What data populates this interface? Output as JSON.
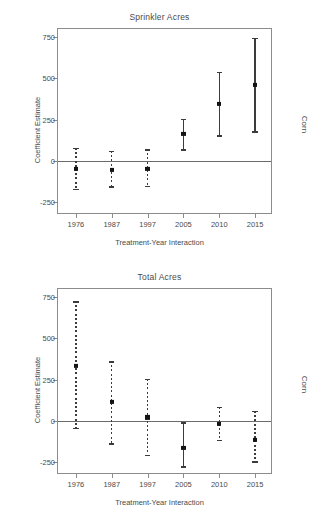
{
  "figure": {
    "strip_label": "Corn",
    "xlabel": "Treatment-Year Interaction",
    "ylabel": "Coefficient Estimate"
  },
  "chart_data": [
    {
      "type": "scatter",
      "title": "Sprinkler Acres",
      "xlabel": "Treatment-Year Interaction",
      "ylabel": "Coefficient Estimate",
      "strip_label": "Corn",
      "grid": false,
      "legend": "none",
      "zero_reference_line": 0,
      "ylim": [
        -330,
        800
      ],
      "yticks": [
        750,
        500,
        250,
        0,
        -250
      ],
      "ytick_labels": [
        "750",
        "500",
        "250",
        "0",
        "-250"
      ],
      "categories": [
        "1976",
        "1987",
        "1997",
        "2005",
        "2010",
        "2015"
      ],
      "values": [
        -50,
        -55,
        -50,
        165,
        345,
        460
      ],
      "ci_low": [
        -180,
        -165,
        -160,
        60,
        145,
        170
      ],
      "ci_high": [
        80,
        60,
        70,
        255,
        540,
        745
      ],
      "significant": [
        false,
        false,
        false,
        true,
        true,
        true
      ],
      "linestyle": [
        "dashed",
        "dashed",
        "dashed",
        "solid",
        "solid",
        "solid"
      ]
    },
    {
      "type": "scatter",
      "title": "Total Acres",
      "xlabel": "Treatment-Year Interaction",
      "ylabel": "Coefficient Estimate",
      "strip_label": "Corn",
      "grid": false,
      "legend": "none",
      "zero_reference_line": 0,
      "ylim": [
        -330,
        800
      ],
      "yticks": [
        750,
        500,
        250,
        0,
        -250
      ],
      "ytick_labels": [
        "750",
        "500",
        "250",
        "0",
        "-250"
      ],
      "categories": [
        "1976",
        "1987",
        "1997",
        "2005",
        "2010",
        "2015"
      ],
      "values": [
        335,
        115,
        20,
        -165,
        -20,
        -115
      ],
      "ci_low": [
        -50,
        -145,
        -215,
        -285,
        -125,
        -255
      ],
      "ci_high": [
        725,
        360,
        255,
        -10,
        85,
        60
      ],
      "significant": [
        false,
        false,
        false,
        true,
        false,
        false
      ],
      "linestyle": [
        "dashed",
        "dashed",
        "dashed",
        "solid",
        "dashed",
        "dashed"
      ]
    }
  ],
  "colors": {
    "point": "#141414",
    "errorbar": "#3c3c3c",
    "zero_line": "#6b6b6b",
    "frame": "#8c8c8c",
    "text": "#4a4a4a",
    "background": "#ffffff"
  }
}
